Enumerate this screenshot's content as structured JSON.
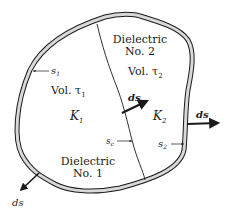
{
  "figure": {
    "regions": [
      {
        "name": "dielectric-2",
        "title_line1": "Dielectric",
        "title_line2": "No. 2",
        "volume": "Vol. τ",
        "volume_sub": "2",
        "constant": "K",
        "constant_sub": "2"
      },
      {
        "name": "dielectric-1",
        "title_line1": "Dielectric",
        "title_line2": "No. 1",
        "volume": "Vol. τ",
        "volume_sub": "1",
        "constant": "K",
        "constant_sub": "1"
      }
    ],
    "surfaces": {
      "s1": {
        "base": "s",
        "sub": "1"
      },
      "s2": {
        "base": "s",
        "sub": "2"
      },
      "sc": {
        "base": "s",
        "sub": "c"
      }
    },
    "vectors": {
      "interface": "ds",
      "right": "ds",
      "bottom_left": "ds"
    },
    "colors": {
      "line": "#1a1a1a",
      "shell_fill": "#d8d8d8",
      "background": "#ffffff"
    }
  }
}
